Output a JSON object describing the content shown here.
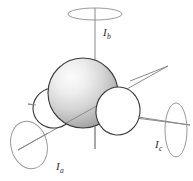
{
  "figure": {
    "name": "principal-axes-of-inertia-diagram",
    "background_color": "#ffffff",
    "axis_line_color": "#8a8a8a",
    "ellipse_stroke_color": "#9a9a9a",
    "outline_color": "#3a3a3a",
    "sphere_fill_light": "#f2f2f2",
    "sphere_fill_dark": "#9c9c9c",
    "lobe_fill": "#ffffff"
  },
  "labels": {
    "axis_b": {
      "symbol": "I",
      "subscript": "b",
      "x": 103,
      "y": 27
    },
    "axis_a": {
      "symbol": "I",
      "subscript": "a",
      "x": 56,
      "y": 161
    },
    "axis_c": {
      "symbol": "I",
      "subscript": "c",
      "x": 155,
      "y": 139
    }
  },
  "axes": [
    {
      "id": "axis-b",
      "label": "I_b",
      "orientation": "vertical",
      "line": {
        "x1": 95,
        "y1": 14,
        "x2": 95,
        "y2": 149
      },
      "ellipse": {
        "cx": 95,
        "cy": 14,
        "rx": 27,
        "ry": 6,
        "rotate": 0
      }
    },
    {
      "id": "axis-c",
      "label": "I_c",
      "orientation": "horizontal",
      "line": {
        "x1": 28,
        "y1": 104,
        "x2": 190,
        "y2": 125
      },
      "ellipse": {
        "cx": 176,
        "cy": 130,
        "rx": 11,
        "ry": 27,
        "rotate": 0
      }
    },
    {
      "id": "axis-a",
      "label": "I_a",
      "orientation": "diagonal",
      "line": {
        "x1": 18,
        "y1": 150,
        "x2": 168,
        "y2": 66
      },
      "ellipse": {
        "cx": 29,
        "cy": 145,
        "rx": 18,
        "ry": 24,
        "rotate": -14
      }
    }
  ],
  "shapes": {
    "sphere": {
      "cx": 83,
      "cy": 93,
      "r": 35
    },
    "lobe_left": {
      "cx": 54,
      "cy": 108,
      "rx": 21,
      "ry": 20,
      "rotate": -10
    },
    "lobe_right": {
      "cx": 118,
      "cy": 111,
      "rx": 22,
      "ry": 24,
      "rotate": 8
    }
  }
}
